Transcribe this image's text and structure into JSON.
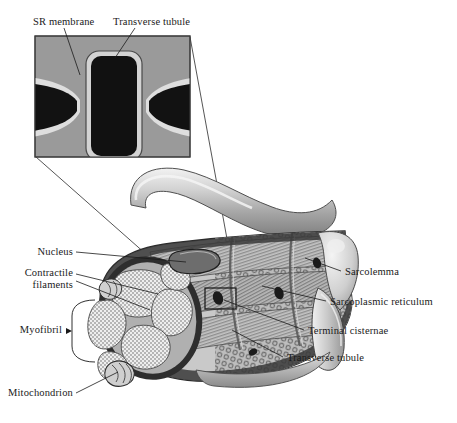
{
  "figure": {
    "background_color": "#ffffff",
    "line_color": "#1a1a1a"
  },
  "inset": {
    "name": "triad-detail-inset",
    "bounds": {
      "x": 35,
      "y": 36,
      "width": 155,
      "height": 121
    },
    "fill_color": "#9a9a9a",
    "border_color": "#4a4a4a",
    "structure_color": "#111111",
    "membrane_color": "#d9d9d9",
    "labels": [
      {
        "id": "sr-membrane",
        "text": "SR membrane",
        "x": 33,
        "y": 16
      },
      {
        "id": "transverse-tubule",
        "text": "Transverse tubule",
        "x": 113,
        "y": 16
      }
    ]
  },
  "detail_box": {
    "name": "triad-detail-box",
    "x": 205,
    "y": 288,
    "width": 31,
    "height": 21
  },
  "labels_left": [
    {
      "id": "nucleus",
      "text": "Nucleus",
      "x": 71,
      "y": 248,
      "align": "right"
    },
    {
      "id": "contractile-filaments",
      "text": "Contractile\nfilaments",
      "x": 22,
      "y": 269,
      "align": "right"
    },
    {
      "id": "myofibril",
      "text": "Myofibril",
      "x": 22,
      "y": 324,
      "align": "right"
    },
    {
      "id": "mitochondrion",
      "text": "Mitochondrion",
      "x": 22,
      "y": 391,
      "align": "right"
    }
  ],
  "labels_right": [
    {
      "id": "sarcolemma",
      "text": "Sarcolemma",
      "x": 345,
      "y": 272
    },
    {
      "id": "sarcoplasmic-reticulum",
      "text": "Sarcoplasmic reticulum",
      "x": 330,
      "y": 302
    },
    {
      "id": "terminal-cisternae",
      "text": "Terminal cisternae",
      "x": 308,
      "y": 331
    },
    {
      "id": "transverse-tubule-right",
      "text": "Transverse tubule",
      "x": 287,
      "y": 358
    }
  ],
  "bracket": {
    "name": "myofibril-bracket",
    "x": 72,
    "y": 300,
    "width": 23,
    "height": 62
  },
  "fiber": {
    "name": "muscle-fiber-body",
    "body_fill": "#c9c9c9",
    "shadow_fill": "#8e8e8e",
    "highlight_fill": "#ececec",
    "outline": "#2a2a2a",
    "myofibril_fill": "#e8e8e8",
    "stipple_color": "#555555",
    "sr_fill": "#b4b4b4"
  }
}
